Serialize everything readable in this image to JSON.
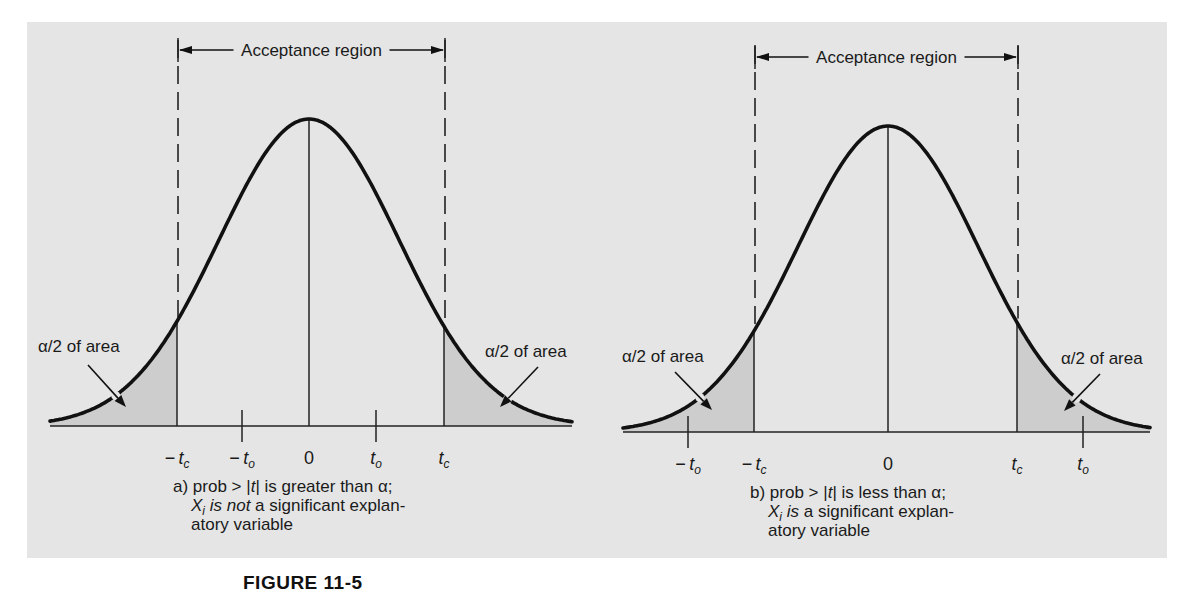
{
  "figure": {
    "title": "FIGURE 11-5",
    "panel": {
      "x": 27,
      "y": 22,
      "width": 1140,
      "height": 536,
      "bg": "#e5e5e5"
    },
    "tail_fill": "#cdcdcd"
  },
  "chart_data": [
    {
      "type": "area",
      "id": "a",
      "title": "Acceptance region",
      "curve": {
        "x_start": 50,
        "x_end": 572,
        "peak_x": 309,
        "peak_y": 119,
        "axis_y": 426,
        "sigma_px": 90
      },
      "critical_lines": {
        "neg_tc_x": 177,
        "tc_x": 444
      },
      "dashed_top": 40,
      "arrow_y": 50,
      "ticks": [
        {
          "label_main": "−t",
          "label_sub": "c",
          "x": 177,
          "has_tick": false
        },
        {
          "label_main": "−t",
          "label_sub": "o",
          "x": 242,
          "has_tick": true
        },
        {
          "label_main": "0",
          "label_sub": "",
          "x": 309,
          "has_tick": false
        },
        {
          "label_main": "t",
          "label_sub": "o",
          "x": 376,
          "has_tick": true
        },
        {
          "label_main": "t",
          "label_sub": "c",
          "x": 444,
          "has_tick": false
        }
      ],
      "tail_labels": [
        {
          "text": "α/2 of area",
          "x": 38,
          "y": 352,
          "arrow_from": [
            88,
            365
          ],
          "arrow_to": [
            126,
            407
          ]
        },
        {
          "text": "α/2 of area",
          "x": 485,
          "y": 357,
          "arrow_from": [
            538,
            367
          ],
          "arrow_to": [
            500,
            407
          ]
        }
      ],
      "caption": {
        "x": 173,
        "lines": [
          {
            "prefix": "a) ",
            "parts": [
              {
                "t": "prob > |",
                "i": false
              },
              {
                "t": "t",
                "i": true
              },
              {
                "t": "| is greater than α;",
                "i": false
              }
            ]
          },
          {
            "prefix": "",
            "parts": [
              {
                "t": "X",
                "i": true
              },
              {
                "t": "i",
                "i": true,
                "sub": true
              },
              {
                "t": " is not",
                "i": true
              },
              {
                "t": " a significant explan-",
                "i": false
              }
            ]
          },
          {
            "prefix": "",
            "parts": [
              {
                "t": "atory variable",
                "i": false
              }
            ]
          }
        ]
      },
      "annotation": "a) prob > |t| is greater than α; X_i is not a significant explanatory variable"
    },
    {
      "type": "area",
      "id": "b",
      "title": "Acceptance region",
      "curve": {
        "x_start": 623,
        "x_end": 1150,
        "peak_x": 888,
        "peak_y": 126,
        "axis_y": 432,
        "sigma_px": 90
      },
      "critical_lines": {
        "neg_tc_x": 754,
        "tc_x": 1017
      },
      "dashed_top": 46,
      "arrow_y": 57,
      "ticks": [
        {
          "label_main": "−t",
          "label_sub": "o",
          "x": 688,
          "has_tick": true
        },
        {
          "label_main": "−t",
          "label_sub": "c",
          "x": 754,
          "has_tick": false
        },
        {
          "label_main": "0",
          "label_sub": "",
          "x": 888,
          "has_tick": false
        },
        {
          "label_main": "t",
          "label_sub": "c",
          "x": 1017,
          "has_tick": false
        },
        {
          "label_main": "t",
          "label_sub": "o",
          "x": 1083,
          "has_tick": true
        }
      ],
      "tail_labels": [
        {
          "text": "α/2 of area",
          "x": 622,
          "y": 362,
          "arrow_from": [
            675,
            372
          ],
          "arrow_to": [
            712,
            410
          ]
        },
        {
          "text": "α/2 of area",
          "x": 1061,
          "y": 364,
          "arrow_from": [
            1100,
            374
          ],
          "arrow_to": [
            1064,
            411
          ]
        }
      ],
      "caption": {
        "x": 750,
        "lines": [
          {
            "prefix": "b) ",
            "parts": [
              {
                "t": "prob > |",
                "i": false
              },
              {
                "t": "t",
                "i": true
              },
              {
                "t": "| is less than α;",
                "i": false
              }
            ]
          },
          {
            "prefix": "",
            "parts": [
              {
                "t": "X",
                "i": true
              },
              {
                "t": "i",
                "i": true,
                "sub": true
              },
              {
                "t": " is",
                "i": true
              },
              {
                "t": " a significant explan-",
                "i": false
              }
            ]
          },
          {
            "prefix": "",
            "parts": [
              {
                "t": "atory variable",
                "i": false
              }
            ]
          }
        ]
      },
      "annotation": "b) prob > |t| is less than α; X_i is a significant explanatory variable"
    }
  ]
}
